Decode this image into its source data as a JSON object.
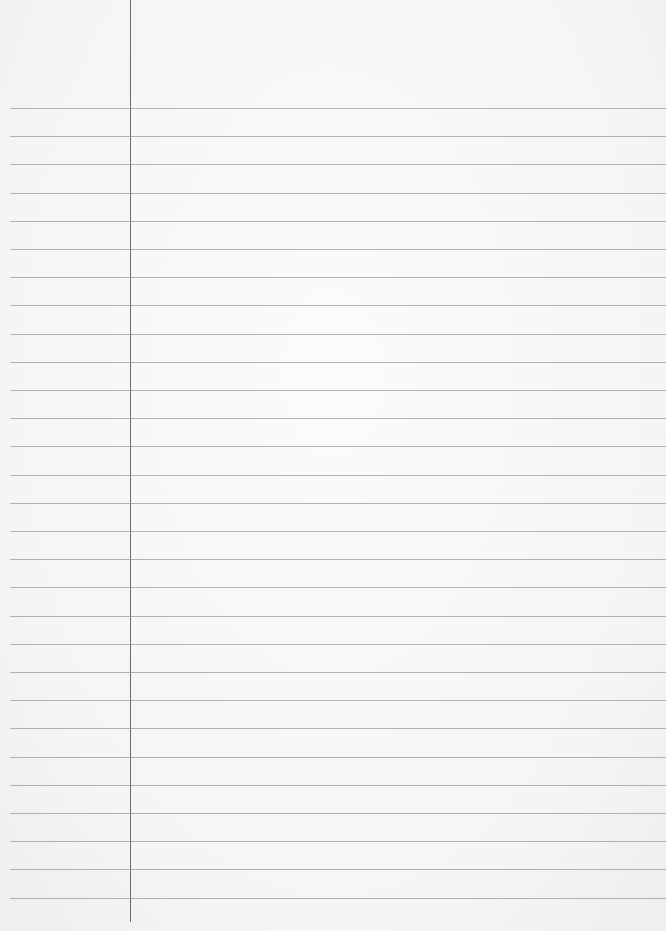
{
  "paper": {
    "type": "lined-paper",
    "line_count": 29,
    "first_line_y": 108,
    "line_spacing": 28.2,
    "line_color": "#9a9a9a",
    "margin_line_x": 130,
    "margin_line_color": "#6a6a6a",
    "background_color": "#f7f7f7",
    "text": ""
  }
}
